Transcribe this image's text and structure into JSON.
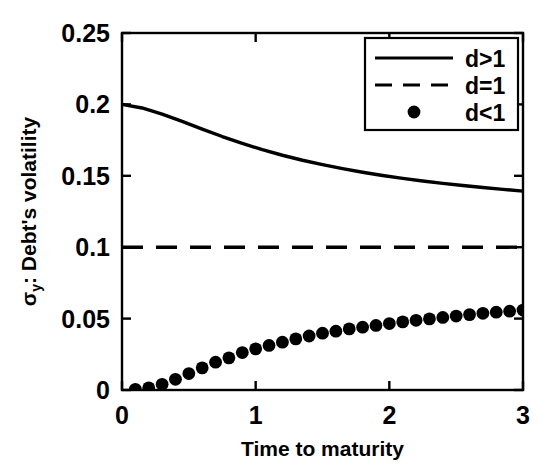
{
  "chart_data": {
    "type": "line",
    "title": "",
    "xlabel": "Time to maturity",
    "ylabel": "σy: Debt's volatility",
    "ylabel_main": "σ",
    "ylabel_sub": "y",
    "ylabel_rest": ": Debt's volatility",
    "xlim": [
      0,
      3
    ],
    "ylim": [
      0,
      0.25
    ],
    "xticks": [
      0,
      1,
      2,
      3
    ],
    "xtick_labels": [
      "0",
      "1",
      "2",
      "3"
    ],
    "yticks": [
      0,
      0.05,
      0.1,
      0.15,
      0.2,
      0.25
    ],
    "ytick_labels": [
      "0",
      "0.05",
      "0.1",
      "0.15",
      "0.2",
      "0.25"
    ],
    "grid": false,
    "legend_position": "top-right",
    "legend_entries": [
      {
        "label": "d>1",
        "style": "solid"
      },
      {
        "label": "d=1",
        "style": "dashed"
      },
      {
        "label": "d<1",
        "style": "marker"
      }
    ],
    "series": [
      {
        "name": "d>1",
        "style": "solid",
        "color": "#000000",
        "x": [
          0.0,
          0.15,
          0.3,
          0.45,
          0.6,
          0.75,
          0.9,
          1.05,
          1.2,
          1.35,
          1.5,
          1.65,
          1.8,
          1.95,
          2.1,
          2.25,
          2.4,
          2.55,
          2.7,
          2.85,
          3.0
        ],
        "y": [
          0.2,
          0.1975,
          0.1932,
          0.1881,
          0.1827,
          0.1775,
          0.1727,
          0.1683,
          0.1644,
          0.1609,
          0.1578,
          0.155,
          0.1525,
          0.1502,
          0.1482,
          0.1464,
          0.1447,
          0.1432,
          0.1418,
          0.1405,
          0.1393
        ]
      },
      {
        "name": "d=1",
        "style": "dashed",
        "color": "#000000",
        "x": [
          0,
          3
        ],
        "y": [
          0.1,
          0.1
        ]
      },
      {
        "name": "d<1",
        "style": "marker",
        "marker": "filled-circle",
        "color": "#000000",
        "x": [
          0.1,
          0.2,
          0.3,
          0.4,
          0.5,
          0.6,
          0.7,
          0.8,
          0.9,
          1.0,
          1.1,
          1.2,
          1.3,
          1.4,
          1.5,
          1.6,
          1.7,
          1.8,
          1.9,
          2.0,
          2.1,
          2.2,
          2.3,
          2.4,
          2.5,
          2.6,
          2.7,
          2.8,
          2.9,
          3.0
        ],
        "y": [
          0.0005,
          0.0015,
          0.004,
          0.0075,
          0.0115,
          0.0155,
          0.0195,
          0.0225,
          0.0262,
          0.0288,
          0.0312,
          0.0335,
          0.0358,
          0.0378,
          0.0398,
          0.0412,
          0.0428,
          0.044,
          0.0452,
          0.0465,
          0.0477,
          0.0488,
          0.0498,
          0.0508,
          0.0518,
          0.0528,
          0.0537,
          0.0545,
          0.0552,
          0.056
        ]
      }
    ]
  },
  "axes": {
    "line_color": "#000000",
    "background": "#ffffff"
  }
}
